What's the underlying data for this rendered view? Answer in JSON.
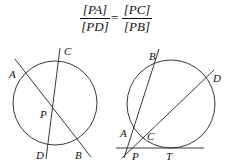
{
  "formula": {
    "left_numerator": "[PA]",
    "left_denominator": "[PD]",
    "equals": "=",
    "right_numerator": "[PC]",
    "right_denominator": "[PB]"
  },
  "diagram_left": {
    "labels": {
      "A": "A",
      "C": "C",
      "P": "P",
      "D": "D",
      "B": "B"
    }
  },
  "diagram_right": {
    "labels": {
      "B": "B",
      "D": "D",
      "A": "A",
      "C": "C",
      "P": "P",
      "T": "T"
    }
  },
  "colors": {
    "stroke": "#222222",
    "text": "#111111",
    "background": "#ffffff"
  }
}
